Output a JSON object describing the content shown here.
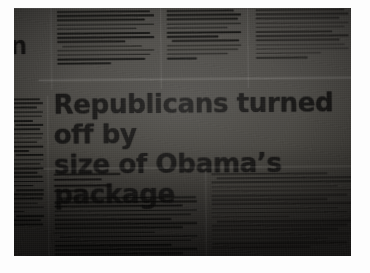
{
  "media": {
    "kind": "photograph-of-newspaper",
    "subject": "newspaper page held under dim light",
    "frame_color": "#fdfdfd",
    "newsprint_color": "#4c4a46",
    "ink_color": "#141312"
  },
  "newspaper": {
    "headline": {
      "line1": "Republicans turned off by",
      "line2": "size of Obama’s package",
      "full": "Republicans turned off by size of Obama’s package"
    },
    "edge_headline": {
      "fragment_line1": "en",
      "fragment_line2": "s"
    },
    "byline": {
      "reporter": "",
      "title": "",
      "outlet": ""
    },
    "columns": [
      {
        "id": "top-left",
        "label": "top story column left",
        "legible": false
      },
      {
        "id": "top-center",
        "label": "top story column center",
        "legible": false
      },
      {
        "id": "top-right",
        "label": "top story column right",
        "legible": false
      },
      {
        "id": "side-left",
        "label": "left margin column",
        "legible": false
      },
      {
        "id": "body-left",
        "label": "article column left",
        "legible": false
      },
      {
        "id": "body-right",
        "label": "article column right",
        "legible": false
      }
    ],
    "rules": {
      "above_headline": true,
      "below_headline": true,
      "column_dividers": true
    }
  }
}
